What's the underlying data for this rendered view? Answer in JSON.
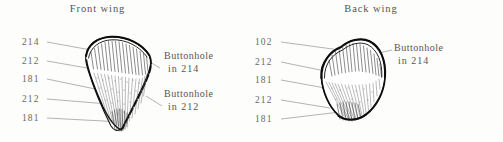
{
  "figure": {
    "background_color": "#fdfdfc",
    "ink_color": "#151515",
    "text_color": "#575553"
  },
  "panels": [
    {
      "id": "front-wing",
      "title": "Front wing",
      "shape": "pointed-teardrop-wing",
      "left_labels": [
        {
          "text": "214",
          "top": 38
        },
        {
          "text": "212",
          "top": 57
        },
        {
          "text": "181",
          "top": 75
        },
        {
          "text": "212",
          "top": 95
        },
        {
          "text": "181",
          "top": 114
        }
      ],
      "callouts": [
        {
          "line1": "Buttonhole",
          "line2": "in 214",
          "top": 50
        },
        {
          "line1": "Buttonhole",
          "line2": "in 212",
          "top": 88
        }
      ]
    },
    {
      "id": "back-wing",
      "title": "Back wing",
      "shape": "rounded-oval-wing",
      "left_labels": [
        {
          "text": "102",
          "top": 38
        },
        {
          "text": "212",
          "top": 58
        },
        {
          "text": "181",
          "top": 76
        },
        {
          "text": "212",
          "top": 96
        },
        {
          "text": "181",
          "top": 115
        }
      ],
      "callouts": [
        {
          "line1": "Buttonhole",
          "line2": "in 214",
          "top": 42
        }
      ]
    }
  ]
}
